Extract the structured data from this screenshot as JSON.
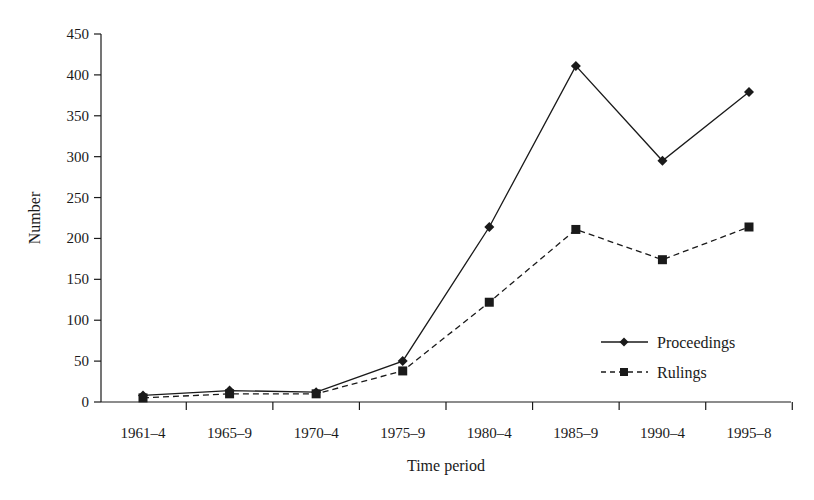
{
  "chart_data": {
    "type": "line",
    "title": "",
    "xlabel": "Time period",
    "ylabel": "Number",
    "ylim": [
      0,
      450
    ],
    "yticks": [
      0,
      50,
      100,
      150,
      200,
      250,
      300,
      350,
      400,
      450
    ],
    "ytick_labels": [
      "0",
      "50",
      "100",
      "150",
      "200",
      "250",
      "300",
      "350",
      "400",
      "450"
    ],
    "categories": [
      "1961–4",
      "1965–9",
      "1970–4",
      "1975–9",
      "1980–4",
      "1985–9",
      "1990–4",
      "1995–8"
    ],
    "series": [
      {
        "name": "Proceedings",
        "marker": "diamond",
        "line_style": "solid",
        "values": [
          8,
          14,
          12,
          50,
          214,
          411,
          295,
          379
        ]
      },
      {
        "name": "Rulings",
        "marker": "square",
        "line_style": "dashed",
        "values": [
          5,
          10,
          10,
          38,
          122,
          211,
          174,
          214
        ]
      }
    ],
    "grid": false,
    "legend_position": "lower right inside plot"
  },
  "colors": {
    "ink": "#1a1a1a",
    "background": "#ffffff"
  }
}
